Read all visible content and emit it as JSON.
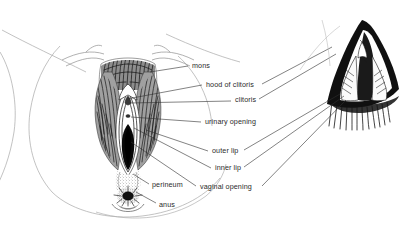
{
  "figure": {
    "type": "labeled-anatomical-illustration",
    "background_color": "#ffffff",
    "ink_color": "#1a1a1a",
    "text_color": "#2b2b2b",
    "leader_line_color": "#333333",
    "contour_line_color": "#9a9a9a"
  },
  "drawings": [
    {
      "name": "main-frontal-view",
      "description": "Frontal pen-and-ink view of vulva with surrounding thighs, pubic hair, labia, perineum and anus"
    },
    {
      "name": "detail-close-up-view",
      "description": "Enlarged close-up inset of the vulva spread open, upper right"
    }
  ],
  "labels": [
    {
      "id": "mons",
      "text": "mons",
      "x": 192,
      "y": 66
    },
    {
      "id": "hood-of-clitoris",
      "text": "hood of clitoris",
      "x": 206,
      "y": 86
    },
    {
      "id": "clitoris",
      "text": "clitoris",
      "x": 235,
      "y": 101
    },
    {
      "id": "urinary-opening",
      "text": "urinary opening",
      "x": 205,
      "y": 123
    },
    {
      "id": "outer-lip",
      "text": "outer lip",
      "x": 212,
      "y": 152
    },
    {
      "id": "inner-lip",
      "text": "inner lip",
      "x": 215,
      "y": 169
    },
    {
      "id": "vaginal-opening",
      "text": "vaginal opening",
      "x": 200,
      "y": 188
    },
    {
      "id": "perineum",
      "text": "perineum",
      "x": 152,
      "y": 186
    },
    {
      "id": "anus",
      "text": "anus",
      "x": 159,
      "y": 206
    }
  ]
}
